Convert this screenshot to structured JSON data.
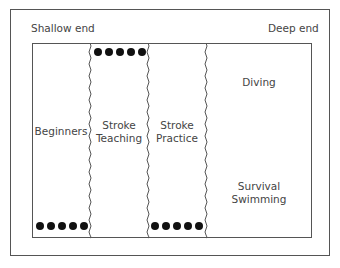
{
  "ends": {
    "shallow": "Shallow end",
    "deep": "Deep end"
  },
  "zones": [
    {
      "id": "beginners",
      "lines": [
        "Beginners"
      ]
    },
    {
      "id": "stroke-teaching",
      "lines": [
        "Stroke",
        "Teaching"
      ]
    },
    {
      "id": "stroke-practice",
      "lines": [
        "Stroke",
        "Practice"
      ]
    },
    {
      "id": "diving",
      "lines": [
        "Diving"
      ]
    },
    {
      "id": "survival-swimming",
      "lines": [
        "Survival",
        "Swimming"
      ]
    }
  ],
  "labels": {
    "beginners": "Beginners",
    "stroke_teaching_1": "Stroke",
    "stroke_teaching_2": "Teaching",
    "stroke_practice_1": "Stroke",
    "stroke_practice_2": "Practice",
    "diving": "Diving",
    "survival_1": "Survival",
    "survival_2": "Swimming"
  },
  "lane_ropes": [
    {
      "x": 90,
      "style": "wavy"
    },
    {
      "x": 148,
      "style": "wavy"
    },
    {
      "x": 206,
      "style": "wavy"
    }
  ],
  "swimmer_groups": [
    {
      "lane": "stroke-teaching",
      "position": "top",
      "count": 5
    },
    {
      "lane": "beginners",
      "position": "bottom",
      "count": 5
    },
    {
      "lane": "stroke-practice",
      "position": "bottom",
      "count": 5
    }
  ],
  "colors": {
    "border": "#555555",
    "text": "#444444",
    "dot": "#111111",
    "background": "#ffffff"
  }
}
